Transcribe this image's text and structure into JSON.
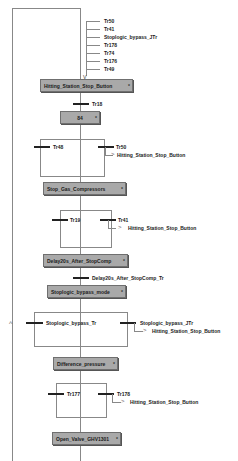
{
  "diagram": {
    "type": "SFC",
    "entry_transitions": [
      "Tr50",
      "Tr41",
      "Stoplogic_bypass_JTr",
      "Tr178",
      "Tr74",
      "Tr176",
      "Tr49"
    ],
    "steps": [
      {
        "name": "Hitting_Station_Stop_Button"
      },
      {
        "name": "84"
      },
      {
        "name": "Stop_Gas_Compressors"
      },
      {
        "name": "Delay20s_After_StopComp"
      },
      {
        "name": "Stoplogic_bypass_mode"
      },
      {
        "name": "Difference_pressure"
      },
      {
        "name": "Open_Valve_GHV1301"
      }
    ],
    "transitions": {
      "t1": "Tr18",
      "b1_left": "Tr48",
      "b1_right": "Tr50",
      "b2_left": "Tr19",
      "b2_right": "Tr41",
      "t2": "Delay20s_After_StopComp_Tr",
      "b3_left": "Stoplogic_bypass_Tr",
      "b3_right": "Stoplogic_bypass_JTr",
      "b4_left": "Tr177",
      "b4_right": "Tr178"
    },
    "jumps": {
      "j1": "Hitting_Station_Stop_Button",
      "j2": "Hitting_Station_Stop_Button",
      "j3": "Hitting_Station_Stop_Button",
      "j4": "Hitting_Station_Stop_Button"
    },
    "marker": "*"
  }
}
